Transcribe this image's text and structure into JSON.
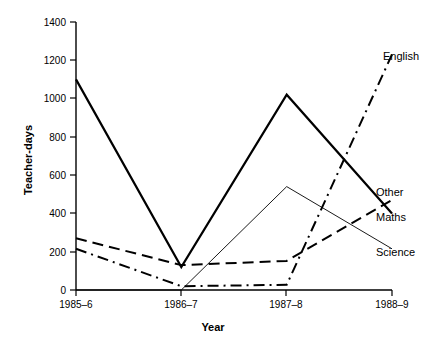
{
  "chart_data": {
    "type": "line",
    "title": "",
    "xlabel": "Year",
    "ylabel": "Teacher-days",
    "categories": [
      "1985–6",
      "1986–7",
      "1987–8",
      "1988–9"
    ],
    "ylim": [
      0,
      1400
    ],
    "yticks": [
      0,
      200,
      400,
      600,
      800,
      1000,
      1200,
      1400
    ],
    "ytick_labels": [
      "0",
      "200",
      "400",
      "600",
      "800",
      "1000",
      "1200",
      "1400"
    ],
    "grid": false,
    "legend_position": "right-inline-labels",
    "series": [
      {
        "name": "Maths",
        "values": [
          1100,
          120,
          1020,
          400
        ],
        "style": "solid-thick"
      },
      {
        "name": "Other",
        "values": [
          270,
          130,
          152,
          470
        ],
        "style": "dashed"
      },
      {
        "name": "English",
        "values": [
          215,
          20,
          27,
          1230
        ],
        "style": "dash-dot"
      },
      {
        "name": "Science",
        "values": [
          0,
          0,
          540,
          215
        ],
        "style": "thin-solid"
      }
    ]
  },
  "axes": {
    "y_title": "Teacher-days",
    "x_title": "Year",
    "y_ticks": [
      "1400",
      "1200",
      "1000",
      "800",
      "600",
      "400",
      "200",
      "0"
    ],
    "x_ticks": [
      "1985–6",
      "1986–7",
      "1987–8",
      "1988–9"
    ]
  },
  "series_labels": {
    "english": "English",
    "other": "Other",
    "maths": "Maths",
    "science": "Science"
  }
}
